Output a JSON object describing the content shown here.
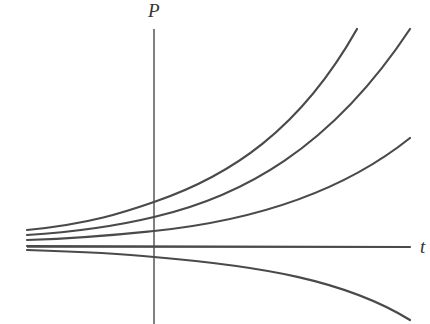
{
  "diagram": {
    "title": "",
    "axes": {
      "vertical_label": "P",
      "horizontal_label": "t"
    },
    "colors": {
      "ink": "#4a4a4a",
      "background": "#ffffff"
    },
    "curves": [
      {
        "name": "growth-fast",
        "description": "steeply increasing exponential, exits top at left"
      },
      {
        "name": "growth-medium",
        "description": "increasing exponential, exits top at right edge"
      },
      {
        "name": "growth-slow",
        "description": "slowly increasing exponential"
      },
      {
        "name": "equilibrium",
        "description": "constant solution along t-axis"
      },
      {
        "name": "decay",
        "description": "decreasing exponential below axis"
      }
    ]
  }
}
